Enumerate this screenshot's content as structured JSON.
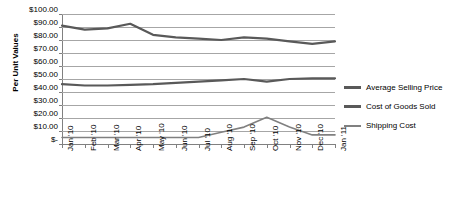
{
  "chart_data": {
    "type": "line",
    "title": "",
    "xlabel": "",
    "ylabel": "Per Unit Values",
    "ylim": [
      0,
      100
    ],
    "ytick_step": 10,
    "grid": true,
    "legend_position": "right",
    "categories": [
      "Jan '10",
      "Feb '10",
      "Mar '10",
      "Apr '10",
      "May '10",
      "Jun '10",
      "Jul '10",
      "Aug '10",
      "Sep '10",
      "Oct '10",
      "Nov '10",
      "Dec '10",
      "Jan '11"
    ],
    "ytick_labels": [
      "$100.00",
      "$90.00",
      "$80.00",
      "$70.00",
      "$60.00",
      "$50.00",
      "$40.00",
      "$30.00",
      "$20.00",
      "$10.00",
      "$-"
    ],
    "ytick_values": [
      100,
      90,
      80,
      70,
      60,
      50,
      40,
      30,
      20,
      10,
      0
    ],
    "series": [
      {
        "name": "Average Selling Price",
        "color": "#595959",
        "values": [
          91.0,
          88.0,
          89.0,
          92.5,
          84.0,
          82.0,
          81.0,
          80.0,
          82.0,
          81.0,
          79.0,
          77.0,
          79.0
        ]
      },
      {
        "name": "Cost of Goods Sold",
        "color": "#595959",
        "values": [
          46.0,
          45.0,
          45.0,
          45.5,
          46.0,
          47.0,
          48.0,
          49.0,
          50.0,
          48.0,
          50.0,
          50.5,
          50.5
        ]
      },
      {
        "name": "Shipping Cost",
        "color": "#808080",
        "values": [
          5.0,
          5.0,
          5.0,
          5.0,
          5.0,
          5.0,
          5.0,
          9.0,
          13.0,
          20.5,
          13.0,
          7.0,
          7.0
        ]
      }
    ]
  },
  "legend": {
    "items": [
      {
        "label": "Average Selling Price",
        "color": "#595959"
      },
      {
        "label": "Cost of Goods Sold",
        "color": "#595959"
      },
      {
        "label": "Shipping Cost",
        "color": "#808080"
      }
    ]
  },
  "axes": {
    "y_title": "Per Unit Values"
  }
}
